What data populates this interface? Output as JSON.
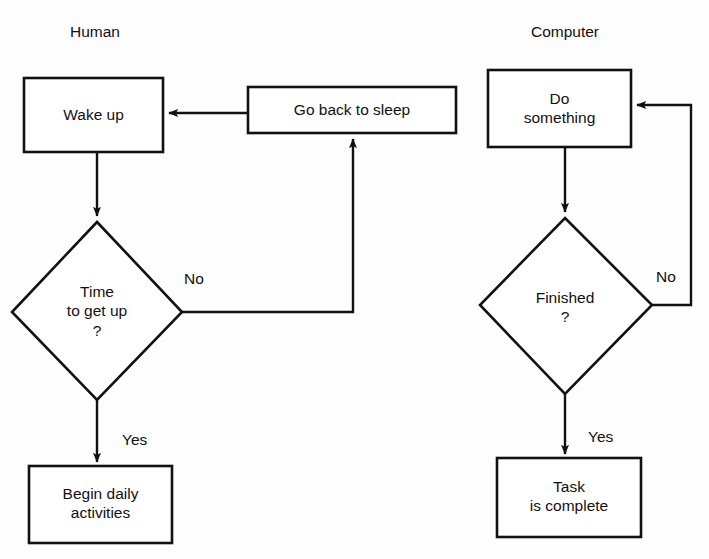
{
  "diagram": {
    "type": "flowchart",
    "background_color": "#fdfdfd",
    "line_color": "#111111",
    "columns": [
      {
        "id": "human",
        "label": "Human"
      },
      {
        "id": "computer",
        "label": "Computer"
      }
    ],
    "nodes": [
      {
        "id": "wake-up",
        "shape": "process",
        "label": "Wake up",
        "column": "human"
      },
      {
        "id": "go-back-sleep",
        "shape": "process",
        "label": "Go back to sleep",
        "column": "human"
      },
      {
        "id": "time-to-get-up",
        "shape": "decision",
        "label": "Time\nto get up\n?",
        "column": "human"
      },
      {
        "id": "begin-daily",
        "shape": "process",
        "label": "Begin daily\nactivities",
        "column": "human"
      },
      {
        "id": "do-something",
        "shape": "process",
        "label": "Do\nsomething",
        "column": "computer"
      },
      {
        "id": "finished",
        "shape": "decision",
        "label": "Finished\n?",
        "column": "computer"
      },
      {
        "id": "task-complete",
        "shape": "process",
        "label": "Task\nis complete",
        "column": "computer"
      }
    ],
    "edges": [
      {
        "id": "wake-to-decision",
        "from": "wake-up",
        "to": "time-to-get-up",
        "label": ""
      },
      {
        "id": "decision-no",
        "from": "time-to-get-up",
        "to": "go-back-sleep",
        "label": "No"
      },
      {
        "id": "sleep-to-wake",
        "from": "go-back-sleep",
        "to": "wake-up",
        "label": ""
      },
      {
        "id": "decision-yes",
        "from": "time-to-get-up",
        "to": "begin-daily",
        "label": "Yes"
      },
      {
        "id": "do-to-finished",
        "from": "do-something",
        "to": "finished",
        "label": ""
      },
      {
        "id": "finished-no",
        "from": "finished",
        "to": "do-something",
        "label": "No"
      },
      {
        "id": "finished-yes",
        "from": "finished",
        "to": "task-complete",
        "label": "Yes"
      }
    ]
  }
}
